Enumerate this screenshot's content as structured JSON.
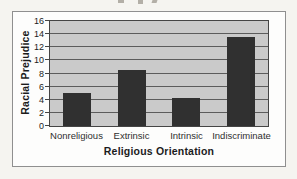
{
  "chart_data": {
    "type": "bar",
    "title": "",
    "categories": [
      "Nonreligious",
      "Extrinsic",
      "Intrinsic",
      "Indiscriminate"
    ],
    "values": [
      5.1,
      8.6,
      4.3,
      13.5
    ],
    "xlabel": "Religious Orientation",
    "ylabel": "Racial Prejudice",
    "ylim": [
      0,
      16
    ],
    "yticks": [
      0,
      2,
      4,
      6,
      8,
      10,
      12,
      14,
      16
    ],
    "grid": "horizontal",
    "legend": "none",
    "colors": {
      "bar": "#303030",
      "plot_bg": "#cacaca",
      "gridline": "#5c5c5c",
      "frame": "#454545",
      "box_border": "#8f8f8f",
      "box_bg": "#fdfdfc",
      "page_bg": "#f5f4f0",
      "text": "#1c1c1c"
    }
  }
}
